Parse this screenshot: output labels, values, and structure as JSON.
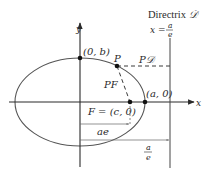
{
  "diagram": {
    "directrix": {
      "label": "Directrix",
      "symbol": "𝒟",
      "equation_lhs": "x =",
      "equation_num": "a",
      "equation_den": "e"
    },
    "axes": {
      "x_label": "x",
      "y_label": "y"
    },
    "points": {
      "top_vertex": "(0, b)",
      "point_p": "P",
      "vertex_right": "(a, 0)",
      "focus": "F = (c, 0)"
    },
    "segments": {
      "pd": "P𝒟",
      "pf": "PF",
      "ae": "ae",
      "a_over_e_num": "a",
      "a_over_e_den": "e"
    },
    "colors": {
      "line": "#3a3a3a",
      "ellipse": "#555555",
      "dashed": "#3a3a3a"
    }
  }
}
